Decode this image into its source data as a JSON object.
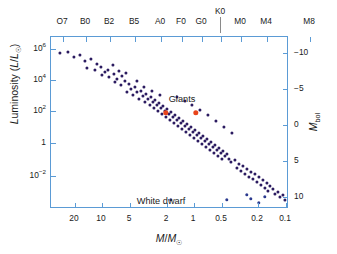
{
  "chart_data": {
    "type": "scatter",
    "title": "",
    "xlabel": "M/M☉",
    "ylabel": "Luminosity (L/L☉)",
    "ylabel_right": "M_bol",
    "xlabel_top": "Spectral type",
    "grid": false,
    "legend_position": "none",
    "x_scale": "log-reversed",
    "y_scale": "log",
    "xlim": [
      30,
      0.07
    ],
    "ylim": [
      0.001,
      3000000.0
    ],
    "ylim_right": [
      14,
      -12
    ],
    "x_ticks": [
      "20",
      "10",
      "5",
      "2",
      "1",
      "0.5",
      "0.2",
      "0.1"
    ],
    "x_tick_values": [
      20,
      10,
      5,
      2,
      1,
      0.5,
      0.2,
      0.1
    ],
    "y_ticks_left": [
      "10⁶",
      "10⁴",
      "10²",
      "1",
      "10⁻²"
    ],
    "y_tick_values_left": [
      1000000,
      10000,
      100,
      1,
      0.01
    ],
    "y_ticks_right": [
      "−10",
      "−5",
      "0",
      "5",
      "10"
    ],
    "y_tick_values_right": [
      -10,
      -5,
      0,
      5,
      10
    ],
    "top_axis_ticks": [
      "O7",
      "B0",
      "B2",
      "B5",
      "A0",
      "F0",
      "G0",
      "K0",
      "M0",
      "M4",
      "M8"
    ],
    "annotations": [
      {
        "text": "Giants",
        "x_px": 181,
        "y_px": 100
      },
      {
        "text": "White dwarf",
        "x_px": 168,
        "y_px": 199
      }
    ],
    "series": [
      {
        "name": "Main sequence",
        "color": "#2b1b60",
        "marker": "circle",
        "points_px": [
          [
            9,
            16
          ],
          [
            17,
            15
          ],
          [
            23,
            20
          ],
          [
            29,
            18
          ],
          [
            34,
            24
          ],
          [
            40,
            22
          ],
          [
            46,
            27
          ],
          [
            36,
            31
          ],
          [
            44,
            33
          ],
          [
            50,
            30
          ],
          [
            54,
            35
          ],
          [
            51,
            38
          ],
          [
            57,
            33
          ],
          [
            58,
            40
          ],
          [
            63,
            37
          ],
          [
            66,
            42
          ],
          [
            64,
            45
          ],
          [
            71,
            39
          ],
          [
            74,
            44
          ],
          [
            70,
            48
          ],
          [
            78,
            47
          ],
          [
            80,
            52
          ],
          [
            76,
            55
          ],
          [
            84,
            50
          ],
          [
            86,
            55
          ],
          [
            82,
            58
          ],
          [
            90,
            54
          ],
          [
            92,
            59
          ],
          [
            88,
            62
          ],
          [
            95,
            57
          ],
          [
            97,
            62
          ],
          [
            94,
            65
          ],
          [
            100,
            60
          ],
          [
            102,
            65
          ],
          [
            99,
            68
          ],
          [
            104,
            63
          ],
          [
            106,
            68
          ],
          [
            103,
            71
          ],
          [
            108,
            66
          ],
          [
            110,
            71
          ],
          [
            107,
            74
          ],
          [
            112,
            69
          ],
          [
            114,
            74
          ],
          [
            111,
            77
          ],
          [
            116,
            72
          ],
          [
            118,
            77
          ],
          [
            115,
            80
          ],
          [
            120,
            75
          ],
          [
            122,
            80
          ],
          [
            119,
            83
          ],
          [
            124,
            78
          ],
          [
            126,
            83
          ],
          [
            123,
            86
          ],
          [
            128,
            81
          ],
          [
            130,
            86
          ],
          [
            127,
            89
          ],
          [
            132,
            84
          ],
          [
            134,
            89
          ],
          [
            131,
            92
          ],
          [
            136,
            87
          ],
          [
            138,
            92
          ],
          [
            135,
            95
          ],
          [
            140,
            90
          ],
          [
            142,
            95
          ],
          [
            139,
            98
          ],
          [
            144,
            93
          ],
          [
            146,
            98
          ],
          [
            143,
            101
          ],
          [
            148,
            96
          ],
          [
            150,
            101
          ],
          [
            147,
            104
          ],
          [
            152,
            99
          ],
          [
            154,
            104
          ],
          [
            151,
            107
          ],
          [
            156,
            102
          ],
          [
            158,
            107
          ],
          [
            155,
            110
          ],
          [
            160,
            105
          ],
          [
            162,
            110
          ],
          [
            159,
            113
          ],
          [
            164,
            108
          ],
          [
            166,
            113
          ],
          [
            163,
            116
          ],
          [
            168,
            111
          ],
          [
            170,
            116
          ],
          [
            167,
            119
          ],
          [
            172,
            114
          ],
          [
            174,
            119
          ],
          [
            171,
            122
          ],
          [
            176,
            117
          ],
          [
            178,
            122
          ],
          [
            180,
            125
          ],
          [
            184,
            123
          ],
          [
            188,
            127
          ],
          [
            186,
            131
          ],
          [
            192,
            129
          ],
          [
            190,
            134
          ],
          [
            196,
            132
          ],
          [
            194,
            137
          ],
          [
            200,
            135
          ],
          [
            198,
            140
          ],
          [
            204,
            137
          ],
          [
            202,
            142
          ],
          [
            208,
            140
          ],
          [
            206,
            145
          ],
          [
            212,
            143
          ],
          [
            210,
            148
          ],
          [
            216,
            146
          ],
          [
            214,
            151
          ],
          [
            219,
            149
          ],
          [
            217,
            154
          ],
          [
            222,
            152
          ],
          [
            224,
            157
          ],
          [
            227,
            155
          ],
          [
            229,
            160
          ],
          [
            232,
            158
          ],
          [
            234,
            163
          ],
          [
            126,
            60
          ],
          [
            134,
            64
          ],
          [
            141,
            68
          ],
          [
            149,
            73
          ],
          [
            157,
            78
          ],
          [
            165,
            84
          ],
          [
            173,
            90
          ],
          [
            181,
            96
          ],
          [
            62,
            28
          ],
          [
            68,
            34
          ],
          [
            75,
            36
          ],
          [
            86,
            44
          ],
          [
            93,
            50
          ],
          [
            101,
            54
          ],
          [
            109,
            58
          ]
        ]
      },
      {
        "name": "Giants",
        "color": "#e8441a",
        "marker": "circle-large",
        "points_px": [
          [
            115,
            76
          ],
          [
            145,
            76
          ]
        ]
      },
      {
        "name": "White dwarfs",
        "color": "#2b3a8f",
        "marker": "circle",
        "points_px": [
          [
            176,
            163
          ],
          [
            196,
            158
          ],
          [
            200,
            162
          ],
          [
            208,
            166
          ],
          [
            214,
            160
          ],
          [
            120,
            163
          ]
        ]
      }
    ]
  },
  "axes": {
    "left": {
      "title": "Luminosity (L/L☉)",
      "ticks": [
        {
          "label_main": "10",
          "label_sup": "6",
          "y_px": 12
        },
        {
          "label_main": "10",
          "label_sup": "4",
          "y_px": 43
        },
        {
          "label_main": "10",
          "label_sup": "2",
          "y_px": 74
        },
        {
          "label_main": "1",
          "label_sup": "",
          "y_px": 106
        },
        {
          "label_main": "10",
          "label_sup": "−2",
          "y_px": 139
        }
      ]
    },
    "right": {
      "title": "Mbol",
      "ticks": [
        {
          "label": "−10",
          "y_px": 16
        },
        {
          "label": "−5",
          "y_px": 52
        },
        {
          "label": "0",
          "y_px": 88
        },
        {
          "label": "5",
          "y_px": 124
        },
        {
          "label": "10",
          "y_px": 160
        }
      ]
    },
    "bottom": {
      "title": "M/M☉",
      "ticks": [
        {
          "label": "20",
          "x_px": 24
        },
        {
          "label": "10",
          "x_px": 51
        },
        {
          "label": "5",
          "x_px": 79
        },
        {
          "label": "2",
          "x_px": 116
        },
        {
          "label": "1",
          "x_px": 143
        },
        {
          "label": "0.5",
          "x_px": 171
        },
        {
          "label": "0.2",
          "x_px": 207
        },
        {
          "label": "0.1",
          "x_px": 235
        }
      ]
    },
    "top": {
      "ticks": [
        {
          "label": "O7",
          "x_px": 12
        },
        {
          "label": "B0",
          "x_px": 35
        },
        {
          "label": "B2",
          "x_px": 59
        },
        {
          "label": "B5",
          "x_px": 84
        },
        {
          "label": "A0",
          "x_px": 110
        },
        {
          "label": "F0",
          "x_px": 131
        },
        {
          "label": "G0",
          "x_px": 151
        },
        {
          "label": "K0",
          "x_px": 170,
          "raised": true
        },
        {
          "label": "M0",
          "x_px": 190
        },
        {
          "label": "M4",
          "x_px": 216
        },
        {
          "label": "M8",
          "x_px": 259
        }
      ]
    }
  },
  "annotations": {
    "giants_label": "Giants",
    "white_dwarf_label": "White dwarf"
  },
  "colors": {
    "frame": "#5b9bd5",
    "main_sequence": "#2b1b60",
    "giants": "#e8441a",
    "white_dwarf": "#2b3a8f",
    "text": "#1a1a1a"
  }
}
